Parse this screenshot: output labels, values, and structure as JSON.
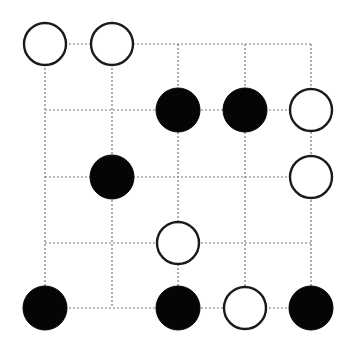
{
  "board": {
    "size": 5,
    "grid_x": [
      45,
      112,
      178,
      245,
      311
    ],
    "grid_y": [
      44,
      110,
      177,
      243,
      308
    ],
    "stone_radius": 22,
    "colors": {
      "background": "#ffffff",
      "grid_line": "#7a7a7a",
      "white_stone_fill": "#ffffff",
      "white_stone_outline": "#1a1a1a",
      "black_stone_fill": "#050505"
    },
    "rows": [
      [
        "W",
        "W",
        ".",
        ".",
        "."
      ],
      [
        ".",
        ".",
        "B",
        "B",
        "W"
      ],
      [
        ".",
        "B",
        ".",
        ".",
        "W"
      ],
      [
        ".",
        ".",
        "W",
        ".",
        "."
      ],
      [
        "B",
        ".",
        "B",
        "W",
        "B"
      ]
    ],
    "stones": [
      {
        "row": 0,
        "col": 0,
        "color": "white"
      },
      {
        "row": 0,
        "col": 1,
        "color": "white"
      },
      {
        "row": 1,
        "col": 2,
        "color": "black"
      },
      {
        "row": 1,
        "col": 3,
        "color": "black"
      },
      {
        "row": 1,
        "col": 4,
        "color": "white"
      },
      {
        "row": 2,
        "col": 1,
        "color": "black"
      },
      {
        "row": 2,
        "col": 4,
        "color": "white"
      },
      {
        "row": 3,
        "col": 2,
        "color": "white"
      },
      {
        "row": 4,
        "col": 0,
        "color": "black"
      },
      {
        "row": 4,
        "col": 2,
        "color": "black"
      },
      {
        "row": 4,
        "col": 3,
        "color": "white"
      },
      {
        "row": 4,
        "col": 4,
        "color": "black"
      }
    ],
    "counts": {
      "white": 6,
      "black": 6
    }
  }
}
